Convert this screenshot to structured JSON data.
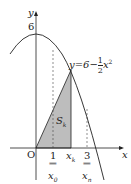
{
  "diagram": {
    "axes": {
      "x_label": "x",
      "y_label": "y",
      "origin_label": "O"
    },
    "y_tick": "6",
    "curve_label": {
      "lhs": "y=6−",
      "num": "1",
      "den": "2",
      "var": "x",
      "exp": "2"
    },
    "region_label": {
      "main": "S",
      "sub": "k"
    },
    "x_ticks": {
      "one": "1",
      "eq1": "‖",
      "x0_main": "x",
      "x0_sub": "0",
      "xk_main": "x",
      "xk_sub": "k",
      "three": "3",
      "eq3": "‖",
      "xn_main": "x",
      "xn_sub": "n"
    },
    "colors": {
      "shade": "#bdbdbd",
      "line": "#222222"
    }
  }
}
